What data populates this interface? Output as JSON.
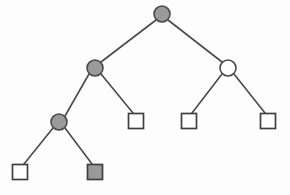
{
  "figure": {
    "background_color": "#fdfdfd",
    "width": 290,
    "height": 195
  },
  "style": {
    "fill_gray": "#9a9a9a",
    "fill_white": "#ffffff",
    "stroke_dark": "#4a4a4a",
    "stroke_square": "#3f3f3f",
    "edge_width": 1.6,
    "circle_radius": 8,
    "square_size": 15
  },
  "legend": {
    "filled_circle_meaning": "internal-node-filled",
    "open_circle_meaning": "internal-node-open",
    "open_square_meaning": "leaf-node-open",
    "filled_square_meaning": "leaf-node-filled"
  },
  "nodes": [
    {
      "id": "root",
      "shape": "circle",
      "fill": "gray",
      "cx": 162,
      "cy": 14,
      "r": 8,
      "label": ""
    },
    {
      "id": "n-l",
      "shape": "circle",
      "fill": "gray",
      "cx": 95,
      "cy": 68,
      "r": 8,
      "label": ""
    },
    {
      "id": "n-r",
      "shape": "circle",
      "fill": "white",
      "cx": 228,
      "cy": 68,
      "r": 8,
      "label": ""
    },
    {
      "id": "n-ll",
      "shape": "circle",
      "fill": "gray",
      "cx": 59,
      "cy": 122,
      "r": 8,
      "label": ""
    },
    {
      "id": "leaf-lr",
      "shape": "square",
      "fill": "white",
      "cx": 136,
      "cy": 121,
      "size": 15,
      "label": ""
    },
    {
      "id": "leaf-rl",
      "shape": "square",
      "fill": "white",
      "cx": 189,
      "cy": 121,
      "size": 15,
      "label": ""
    },
    {
      "id": "leaf-rr",
      "shape": "square",
      "fill": "white",
      "cx": 268,
      "cy": 121,
      "size": 15,
      "label": ""
    },
    {
      "id": "leaf-lll",
      "shape": "square",
      "fill": "white",
      "cx": 20,
      "cy": 172,
      "size": 15,
      "label": ""
    },
    {
      "id": "leaf-llr",
      "shape": "square",
      "fill": "gray",
      "cx": 95,
      "cy": 172,
      "size": 15,
      "label": ""
    }
  ],
  "edges": [
    {
      "id": "edge-root-left",
      "from": "root",
      "to": "n-l",
      "x1": 156,
      "y1": 20,
      "x2": 101,
      "y2": 62
    },
    {
      "id": "edge-root-right",
      "from": "root",
      "to": "n-r",
      "x1": 168,
      "y1": 20,
      "x2": 222,
      "y2": 62
    },
    {
      "id": "edge-l-ll",
      "from": "n-l",
      "to": "n-ll",
      "x1": 89,
      "y1": 74,
      "x2": 65,
      "y2": 116
    },
    {
      "id": "edge-l-lr",
      "from": "n-l",
      "to": "leaf-lr",
      "x1": 101,
      "y1": 74,
      "x2": 133,
      "y2": 113
    },
    {
      "id": "edge-r-rl",
      "from": "n-r",
      "to": "leaf-rl",
      "x1": 222,
      "y1": 74,
      "x2": 192,
      "y2": 113
    },
    {
      "id": "edge-r-rr",
      "from": "n-r",
      "to": "leaf-rr",
      "x1": 234,
      "y1": 74,
      "x2": 265,
      "y2": 113
    },
    {
      "id": "edge-ll-lll",
      "from": "n-ll",
      "to": "leaf-lll",
      "x1": 53,
      "y1": 128,
      "x2": 24,
      "y2": 164
    },
    {
      "id": "edge-ll-llr",
      "from": "n-ll",
      "to": "leaf-llr",
      "x1": 65,
      "y1": 128,
      "x2": 92,
      "y2": 164
    }
  ]
}
